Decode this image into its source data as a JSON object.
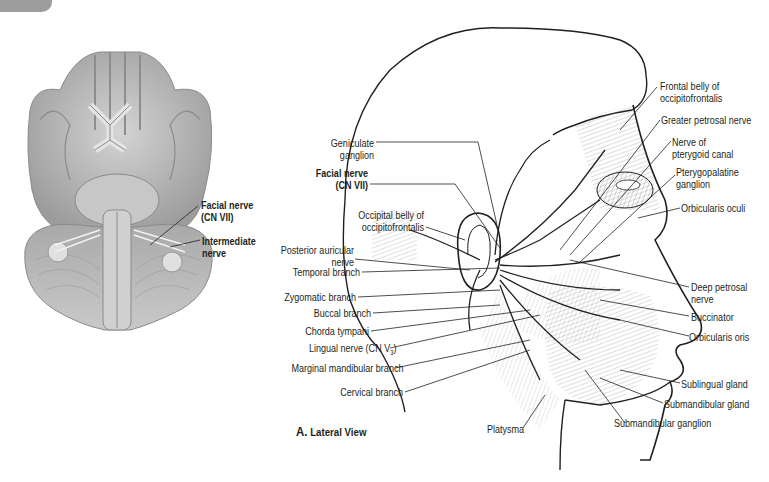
{
  "figure": {
    "panel_caption_letter": "A.",
    "panel_caption_text": "Lateral View",
    "colors": {
      "line": "#231f20",
      "tissue_gray": "#b9b9b9",
      "tab_gray": "#8d8d8d",
      "background": "#ffffff"
    }
  },
  "brain_labels": {
    "facial_nerve_line1": "Facial nerve",
    "facial_nerve_line2": "(CN VII)",
    "intermediate_line1": "Intermediate",
    "intermediate_line2": "nerve"
  },
  "left_labels": {
    "geniculate_1": "Geniculate",
    "geniculate_2": "ganglion",
    "facial_1": "Facial nerve",
    "facial_2": "(CN VII)",
    "occipital_1": "Occipital belly of",
    "occipital_2": "occipitofrontalis",
    "posterior_1": "Posterior auricular",
    "posterior_2": "nerve",
    "temporal": "Temporal branch",
    "zygomatic": "Zygomatic branch",
    "buccal": "Buccal branch",
    "chorda": "Chorda tympani",
    "lingual": "Lingual nerve (CN V",
    "lingual_sub": "3",
    "lingual_close": ")",
    "marginal": "Marginal mandibular branch",
    "cervical": "Cervical branch"
  },
  "right_labels": {
    "frontal_1": "Frontal belly of",
    "frontal_2": "occipitofrontalis",
    "greater_petrosal": "Greater petrosal nerve",
    "pterygoid_1": "Nerve of",
    "pterygoid_2": "pterygoid canal",
    "pterygopalatine_1": "Pterygopalatine",
    "pterygopalatine_2": "ganglion",
    "orbicularis_oculi": "Orbicularis oculi",
    "deep_petrosal_1": "Deep petrosal",
    "deep_petrosal_2": "nerve",
    "buccinator": "Buccinator",
    "orbicularis_oris": "Orbicularis oris",
    "sublingual": "Sublingual gland",
    "submandibular_gland": "Submandibular gland",
    "submandibular_ganglion": "Submandibular ganglion",
    "platysma": "Platysma"
  }
}
